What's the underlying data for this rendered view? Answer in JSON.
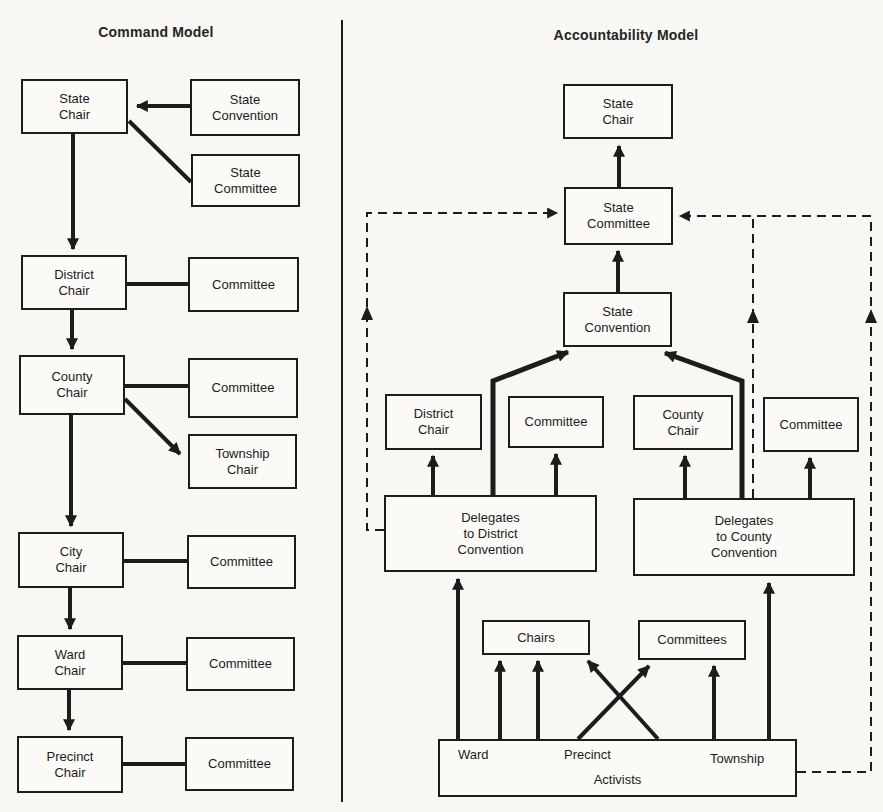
{
  "left_panel": {
    "title": "Command Model",
    "nodes": {
      "state_chair": "State\nChair",
      "state_convention": "State\nConvention",
      "state_committee": "State\nCommittee",
      "district_chair": "District\nChair",
      "district_committee": "Committee",
      "county_chair": "County\nChair",
      "county_committee": "Committee",
      "township_chair": "Township\nChair",
      "city_chair": "City\nChair",
      "city_committee": "Committee",
      "ward_chair": "Ward\nChair",
      "ward_committee": "Committee",
      "precinct_chair": "Precinct\nChair",
      "precinct_committee": "Committee"
    }
  },
  "right_panel": {
    "title": "Accountability Model",
    "nodes": {
      "state_chair": "State\nChair",
      "state_committee": "State\nCommittee",
      "state_convention": "State\nConvention",
      "district_chair": "District\nChair",
      "district_committee": "Committee",
      "county_chair": "County\nChair",
      "county_committee": "Committee",
      "delegates_district": "Delegates\nto District\nConvention",
      "delegates_county": "Delegates\nto County\nConvention",
      "chairs": "Chairs",
      "committees": "Committees",
      "ward": "Ward",
      "precinct": "Precinct",
      "township": "Township",
      "activists": "Activists"
    }
  },
  "colors": {
    "ink": "#1c1c1c",
    "paper": "#f8f7f3"
  }
}
